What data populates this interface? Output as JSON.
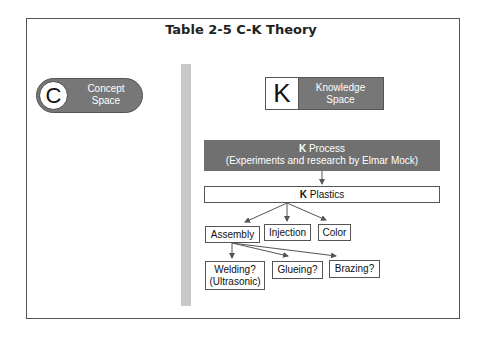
{
  "title": "Table 2-5  C-K Theory",
  "concept": {
    "letter": "C",
    "line1": "Concept",
    "line2": "Space"
  },
  "knowledge": {
    "letter": "K",
    "line1": "Knowledge",
    "line2": "Space"
  },
  "process": {
    "bold": "K",
    "line1": " Process",
    "line2": "(Experiments and research by Elmar Mock)"
  },
  "plastics": {
    "bold": "K",
    "label": " Plastics"
  },
  "level2": [
    "Assembly",
    "Injection",
    "Color"
  ],
  "level3": [
    {
      "line1": "Welding?",
      "line2": "(Ultrasonic)"
    },
    {
      "line1": "Glueing?"
    },
    {
      "line1": "Brazing?"
    }
  ]
}
